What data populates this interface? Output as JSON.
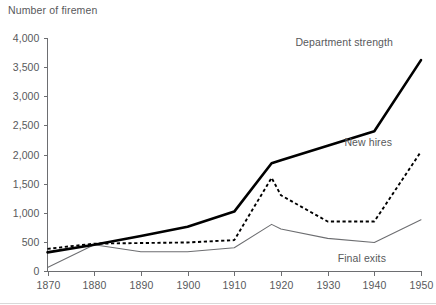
{
  "chart_data": {
    "type": "line",
    "title": "Number of firemen",
    "xlabel": "",
    "ylabel": "Number of firemen",
    "grid": false,
    "legend_position": "inline-annotations",
    "x": [
      1870,
      1880,
      1890,
      1900,
      1910,
      1918,
      1920,
      1930,
      1940,
      1950
    ],
    "xlim": [
      1870,
      1950
    ],
    "ylim": [
      0,
      4000
    ],
    "xticks": [
      "1870",
      "1880",
      "1890",
      "1900",
      "1910",
      "1920",
      "1930",
      "1940",
      "1950"
    ],
    "yticks": [
      "0",
      "500",
      "1,000",
      "1,500",
      "2,000",
      "2,500",
      "3,000",
      "3,500",
      "4,000"
    ],
    "ytick_values": [
      0,
      500,
      1000,
      1500,
      2000,
      2500,
      3000,
      3500,
      4000
    ],
    "series": [
      {
        "name": "Department strength",
        "style": "thick-solid-black",
        "color": "#000000",
        "values": [
          320,
          450,
          600,
          760,
          1020,
          1850,
          1900,
          2150,
          2400,
          3620
        ]
      },
      {
        "name": "New hires",
        "style": "dashed-black",
        "color": "#000000",
        "values": [
          380,
          470,
          480,
          490,
          530,
          1600,
          1300,
          850,
          850,
          2050
        ]
      },
      {
        "name": "Final exits",
        "style": "thin-solid-gray",
        "color": "#6d6e71",
        "values": [
          60,
          450,
          330,
          330,
          400,
          800,
          720,
          560,
          490,
          880
        ]
      }
    ],
    "annotations": [
      {
        "text": "Department strength",
        "series": "Department strength",
        "x": 393,
        "y": 46
      },
      {
        "text": "New hires",
        "series": "New hires",
        "x": 392,
        "y": 146
      },
      {
        "text": "Final exits",
        "series": "Final exits",
        "x": 386,
        "y": 262
      }
    ]
  }
}
